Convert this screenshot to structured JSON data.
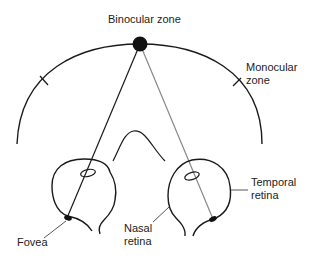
{
  "diagram": {
    "labels": {
      "binocular_zone": "Binocular zone",
      "monocular_line1": "Monocular",
      "monocular_line2": "zone",
      "temporal_line1": "Temporal",
      "temporal_line2": "retina",
      "nasal_line1": "Nasal",
      "nasal_line2": "retina",
      "fovea": "Fovea"
    },
    "elements": {
      "fixation_point": "Fixation point (filled dot on visual field arc)",
      "visual_field_arc": "Visual field arc",
      "left_eye": "Left eye",
      "right_eye": "Right eye",
      "nose": "Nose",
      "left_line_of_sight": "Line from fixation point to left fovea",
      "right_line_of_sight": "Line from fixation point to right temporal retina"
    },
    "colors": {
      "stroke": "#1a1a1a",
      "gray_line": "#888888",
      "text": "#222222",
      "background": "#ffffff"
    }
  }
}
